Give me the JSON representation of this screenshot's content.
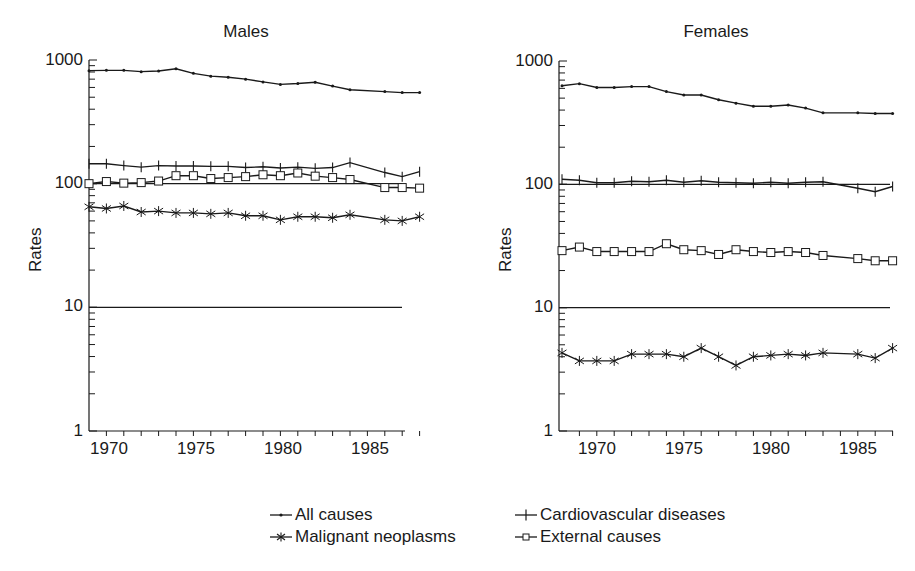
{
  "chart_data": [
    {
      "type": "line",
      "title": "Males",
      "xlabel": "",
      "ylabel": "Rates",
      "yscale": "log",
      "ylim": [
        1,
        1000
      ],
      "xlim": [
        1968,
        1987
      ],
      "yticks": [
        "1000",
        "100",
        "10",
        "1"
      ],
      "xticks": [
        "1970",
        "1975",
        "1980",
        "1985"
      ],
      "reference_lines": [
        100,
        10
      ],
      "grid": false,
      "x": [
        1968,
        1969,
        1970,
        1971,
        1972,
        1973,
        1974,
        1975,
        1976,
        1977,
        1978,
        1979,
        1980,
        1981,
        1982,
        1983,
        1985,
        1986,
        1987
      ],
      "series": [
        {
          "name": "All causes",
          "marker": "dot",
          "values": [
            820,
            825,
            825,
            805,
            815,
            850,
            780,
            740,
            725,
            700,
            665,
            635,
            645,
            660,
            615,
            575,
            555,
            545,
            545
          ]
        },
        {
          "name": "Cardiovascular diseases",
          "marker": "plus",
          "values": [
            145,
            145,
            140,
            136,
            140,
            139,
            139,
            138,
            138,
            135,
            137,
            134,
            136,
            133,
            135,
            148,
            123,
            114,
            125
          ]
        },
        {
          "name": "External causes",
          "marker": "square",
          "values": [
            100,
            104,
            101,
            102,
            105,
            116,
            116,
            110,
            112,
            114,
            118,
            116,
            122,
            115,
            112,
            108,
            93,
            93,
            92
          ]
        },
        {
          "name": "Malignant neoplasms",
          "marker": "asterisk",
          "values": [
            65,
            63,
            66,
            59,
            60,
            58,
            58,
            57,
            58,
            55,
            55,
            51,
            54,
            54,
            53,
            56,
            51,
            50,
            54
          ]
        }
      ]
    },
    {
      "type": "line",
      "title": "Females",
      "xlabel": "",
      "ylabel": "Rates",
      "yscale": "log",
      "ylim": [
        1,
        1000
      ],
      "xlim": [
        1968,
        1987
      ],
      "yticks": [
        "1000",
        "100",
        "10",
        "1"
      ],
      "xticks": [
        "1970",
        "1975",
        "1980",
        "1985"
      ],
      "reference_lines": [
        100,
        10
      ],
      "grid": false,
      "x": [
        1968,
        1969,
        1970,
        1971,
        1972,
        1973,
        1974,
        1975,
        1976,
        1977,
        1978,
        1979,
        1980,
        1981,
        1982,
        1983,
        1985,
        1986,
        1987
      ],
      "series": [
        {
          "name": "All causes",
          "marker": "dot",
          "values": [
            630,
            655,
            610,
            610,
            620,
            620,
            565,
            530,
            530,
            485,
            455,
            430,
            430,
            440,
            415,
            380,
            380,
            375,
            375
          ]
        },
        {
          "name": "Cardiovascular diseases",
          "marker": "plus",
          "values": [
            110,
            108,
            103,
            103,
            106,
            105,
            108,
            104,
            107,
            104,
            103,
            102,
            104,
            102,
            104,
            105,
            93,
            87,
            96
          ]
        },
        {
          "name": "External causes",
          "marker": "square",
          "values": [
            29,
            31,
            28.5,
            28.5,
            28.5,
            28.5,
            33,
            29.5,
            29,
            27,
            29.5,
            28.5,
            28,
            28.5,
            28,
            26.5,
            25,
            24,
            24
          ]
        },
        {
          "name": "Malignant neoplasms",
          "marker": "asterisk",
          "values": [
            4.3,
            3.7,
            3.7,
            3.7,
            4.2,
            4.2,
            4.2,
            4.0,
            4.7,
            4.0,
            3.4,
            4.0,
            4.1,
            4.2,
            4.1,
            4.3,
            4.2,
            3.9,
            4.7
          ]
        }
      ]
    }
  ],
  "panels": {
    "males": {
      "title": "Males",
      "ylabel": "Rates"
    },
    "females": {
      "title": "Females",
      "ylabel": "Rates"
    }
  },
  "axis": {
    "yticks": [
      "1000",
      "100",
      "10",
      "1"
    ],
    "xticks": [
      "1970",
      "1975",
      "1980",
      "1985"
    ]
  },
  "legend": {
    "items": [
      {
        "label": "All causes",
        "marker": "dot"
      },
      {
        "label": "Malignant neoplasms",
        "marker": "asterisk"
      },
      {
        "label": "Cardiovascular diseases",
        "marker": "plus"
      },
      {
        "label": "External causes",
        "marker": "square"
      }
    ]
  },
  "colors": {
    "ink": "#1a1a1a",
    "background": "#ffffff"
  }
}
